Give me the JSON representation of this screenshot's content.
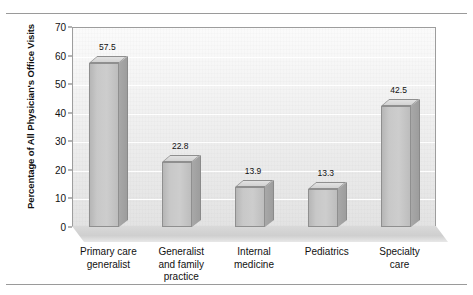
{
  "chart_data": {
    "type": "bar",
    "title": "",
    "xlabel": "",
    "ylabel": "Percentage of All Physician's Office Visits",
    "ylim": [
      0,
      70
    ],
    "yticks": [
      0,
      10,
      20,
      30,
      40,
      50,
      60,
      70
    ],
    "ytick_labels": [
      "0",
      "10",
      "20",
      "30",
      "40",
      "50",
      "60",
      "70"
    ],
    "grid": true,
    "legend": "none",
    "categories": [
      "Primary care\ngeneralist",
      "Generalist\nand family\npractice",
      "Internal\nmedicine",
      "Pediatrics",
      "Specialty\ncare"
    ],
    "category_lines": [
      [
        "Primary care",
        "generalist"
      ],
      [
        "Generalist",
        "and family",
        "practice"
      ],
      [
        "Internal",
        "medicine"
      ],
      [
        "Pediatrics"
      ],
      [
        "Specialty",
        "care"
      ]
    ],
    "values": [
      57.5,
      22.8,
      13.9,
      13.3,
      42.5
    ],
    "value_labels": [
      "57.5",
      "22.8",
      "13.9",
      "13.3",
      "42.5"
    ],
    "style": {
      "bar_fill": "#c8c8c8",
      "bar_edge": "#8f8f8f",
      "bar_side": "#a0a0a0",
      "plot_bg": "#eeeeee",
      "gridline_color": "#ffffff",
      "frame_color": "#9d9d9d",
      "text_color": "#111111",
      "rule_color": "#9a9a9a"
    }
  }
}
